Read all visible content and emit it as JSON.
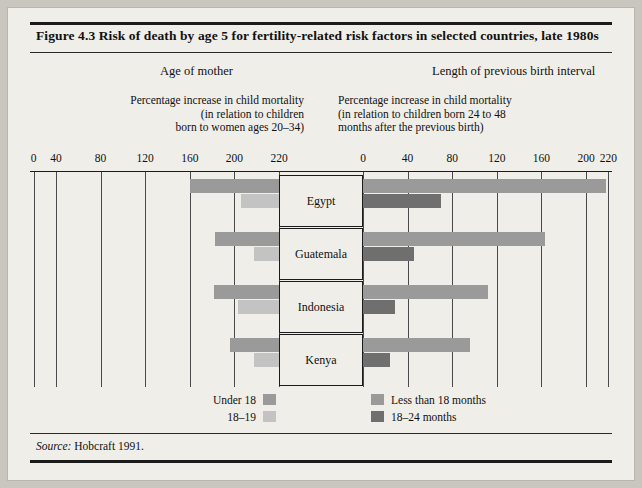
{
  "figure": {
    "title": "Figure 4.3  Risk of death by age 5 for fertility-related risk factors in selected countries, late 1980s",
    "source_label": "Source:",
    "source_text": "Hobcraft 1991."
  },
  "panels": {
    "left": {
      "heading": "Age of mother",
      "caption_line1": "Percentage increase in child mortality",
      "caption_line2": "(in relation to children",
      "caption_line3": "born to women ages 20–34)",
      "ticks": [
        "220",
        "200",
        "160",
        "120",
        "80",
        "40",
        "0"
      ]
    },
    "right": {
      "heading": "Length of previous birth interval",
      "caption_line1": "Percentage increase in child mortality",
      "caption_line2": "(in relation to children born 24 to 48",
      "caption_line3": "months after the previous birth)",
      "ticks": [
        "0",
        "40",
        "80",
        "120",
        "160",
        "200",
        "220"
      ]
    }
  },
  "legend": {
    "left": [
      {
        "label": "Under 18",
        "color": "#9a9a9a"
      },
      {
        "label": "18–19",
        "color": "#c3c3c3"
      }
    ],
    "right": [
      {
        "label": "Less than 18 months",
        "color": "#9a9a9a"
      },
      {
        "label": "18–24 months",
        "color": "#6f6f6f"
      }
    ]
  },
  "countries": [
    "Egypt",
    "Guatemala",
    "Indonesia",
    "Kenya"
  ],
  "chart_data": {
    "type": "bar",
    "title": "Figure 4.3  Risk of death by age 5 for fertility-related risk factors in selected countries, late 1980s",
    "orientation": "horizontal",
    "layout": "back-to-back dual panel",
    "categories": [
      "Egypt",
      "Guatemala",
      "Indonesia",
      "Kenya"
    ],
    "panels": [
      {
        "name": "Age of mother",
        "xlabel": "Percentage increase in child mortality (in relation to children born to women ages 20–34)",
        "direction": "left",
        "xlim": [
          0,
          220
        ],
        "ticks": [
          0,
          40,
          80,
          120,
          160,
          200,
          220
        ],
        "series": [
          {
            "name": "Under 18",
            "color": "#9a9a9a",
            "values": [
              80,
              57,
              58,
              44
            ]
          },
          {
            "name": "18–19",
            "color": "#c3c3c3",
            "values": [
              34,
              22,
              37,
              22
            ]
          }
        ]
      },
      {
        "name": "Length of previous birth interval",
        "xlabel": "Percentage increase in child mortality (in relation to children born 24 to 48 months after the previous birth)",
        "direction": "right",
        "xlim": [
          0,
          220
        ],
        "ticks": [
          0,
          40,
          80,
          120,
          160,
          200,
          220
        ],
        "series": [
          {
            "name": "Less than 18 months",
            "color": "#9a9a9a",
            "values": [
              218,
              163,
              112,
              96
            ]
          },
          {
            "name": "18–24 months",
            "color": "#6f6f6f",
            "values": [
              70,
              46,
              29,
              24
            ]
          }
        ]
      }
    ],
    "grid": true,
    "legend_position": "bottom"
  }
}
